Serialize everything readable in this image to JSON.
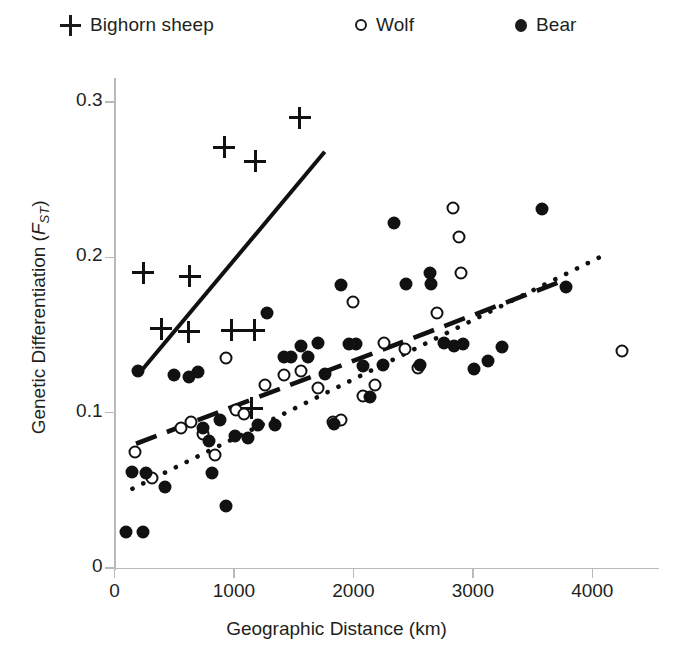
{
  "legend": {
    "items": [
      {
        "label": "Bighorn sheep",
        "marker": "plus-icon",
        "color": "#111111"
      },
      {
        "label": "Wolf",
        "marker": "open-circle-icon",
        "color": "#111111"
      },
      {
        "label": "Bear",
        "marker": "filled-circle-icon",
        "color": "#111111"
      }
    ]
  },
  "chart_data": {
    "type": "scatter",
    "title": "",
    "xlabel": "Geographic Distance (km)",
    "ylabel": "Genetic Differentiation (FST)",
    "ylabel_main": "Genetic Differentiation (",
    "ylabel_italic": "F",
    "ylabel_sub": "ST",
    "ylabel_close": ")",
    "xlim": [
      0,
      4570
    ],
    "ylim": [
      0,
      0.318
    ],
    "xticks": [
      0,
      1000,
      2000,
      3000,
      4000
    ],
    "xticklabels": [
      "0",
      "1000",
      "2000",
      "3000",
      "4000"
    ],
    "yticks": [
      0,
      0.1,
      0.2,
      0.3
    ],
    "yticklabels": [
      "0",
      "0.1",
      "0.2",
      "0.3"
    ],
    "grid": false,
    "legend_position": "top",
    "series": [
      {
        "name": "Bighorn sheep",
        "marker": "plus",
        "color": "#111111",
        "points": [
          [
            240,
            0.19
          ],
          [
            630,
            0.188
          ],
          [
            390,
            0.154
          ],
          [
            620,
            0.152
          ],
          [
            980,
            0.153
          ],
          [
            1170,
            0.153
          ],
          [
            920,
            0.271
          ],
          [
            1180,
            0.262
          ],
          [
            1550,
            0.29
          ],
          [
            1150,
            0.103
          ]
        ],
        "trendline": {
          "style": "solid",
          "x_start": 225,
          "y_start": 0.127,
          "x_end": 1760,
          "y_end": 0.268
        }
      },
      {
        "name": "Wolf",
        "marker": "open-circle",
        "color": "#111111",
        "points": [
          [
            175,
            0.075
          ],
          [
            310,
            0.058
          ],
          [
            560,
            0.09
          ],
          [
            640,
            0.094
          ],
          [
            740,
            0.086
          ],
          [
            840,
            0.073
          ],
          [
            930,
            0.135
          ],
          [
            1020,
            0.102
          ],
          [
            1080,
            0.099
          ],
          [
            1260,
            0.118
          ],
          [
            1420,
            0.124
          ],
          [
            1560,
            0.127
          ],
          [
            1700,
            0.116
          ],
          [
            1830,
            0.094
          ],
          [
            1900,
            0.095
          ],
          [
            2000,
            0.171
          ],
          [
            2080,
            0.111
          ],
          [
            2180,
            0.118
          ],
          [
            2260,
            0.145
          ],
          [
            2430,
            0.141
          ],
          [
            2540,
            0.129
          ],
          [
            2700,
            0.164
          ],
          [
            2830,
            0.232
          ],
          [
            2880,
            0.213
          ],
          [
            2900,
            0.19
          ],
          [
            4250,
            0.14
          ]
        ],
        "trendline": {
          "style": "dashed",
          "x_start": 180,
          "y_start": 0.08,
          "x_end": 3790,
          "y_end": 0.186
        }
      },
      {
        "name": "Bear",
        "marker": "filled-circle",
        "color": "#111111",
        "points": [
          [
            95,
            0.023
          ],
          [
            240,
            0.023
          ],
          [
            150,
            0.062
          ],
          [
            260,
            0.061
          ],
          [
            420,
            0.052
          ],
          [
            200,
            0.127
          ],
          [
            500,
            0.124
          ],
          [
            620,
            0.123
          ],
          [
            700,
            0.126
          ],
          [
            740,
            0.09
          ],
          [
            790,
            0.082
          ],
          [
            820,
            0.061
          ],
          [
            880,
            0.095
          ],
          [
            930,
            0.04
          ],
          [
            1010,
            0.085
          ],
          [
            1120,
            0.084
          ],
          [
            1200,
            0.092
          ],
          [
            1280,
            0.164
          ],
          [
            1340,
            0.092
          ],
          [
            1420,
            0.136
          ],
          [
            1480,
            0.136
          ],
          [
            1560,
            0.143
          ],
          [
            1620,
            0.136
          ],
          [
            1700,
            0.145
          ],
          [
            1760,
            0.125
          ],
          [
            1840,
            0.093
          ],
          [
            1900,
            0.182
          ],
          [
            1960,
            0.144
          ],
          [
            2020,
            0.144
          ],
          [
            2080,
            0.13
          ],
          [
            2140,
            0.11
          ],
          [
            2250,
            0.131
          ],
          [
            2340,
            0.222
          ],
          [
            2440,
            0.183
          ],
          [
            2560,
            0.131
          ],
          [
            2640,
            0.19
          ],
          [
            2650,
            0.183
          ],
          [
            2760,
            0.145
          ],
          [
            2840,
            0.143
          ],
          [
            2920,
            0.144
          ],
          [
            3010,
            0.128
          ],
          [
            3130,
            0.133
          ],
          [
            3240,
            0.142
          ],
          [
            3580,
            0.231
          ],
          [
            3780,
            0.181
          ]
        ],
        "trendline": {
          "style": "dotted",
          "x_start": 150,
          "y_start": 0.051,
          "x_end": 4060,
          "y_end": 0.2
        }
      }
    ]
  }
}
